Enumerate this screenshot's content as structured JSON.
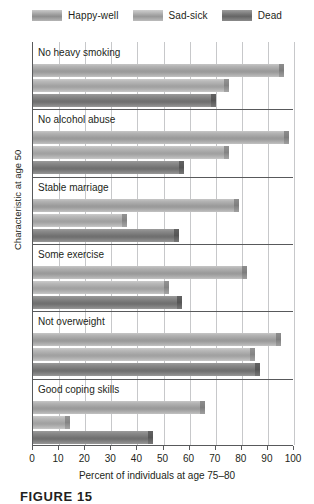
{
  "chart_data": {
    "type": "bar",
    "orientation": "horizontal",
    "title": "",
    "xlabel": "Percent of individuals at age 75–80",
    "ylabel": "Characteristic at age 50",
    "xlim": [
      0,
      100
    ],
    "xticks": [
      0,
      10,
      20,
      30,
      40,
      50,
      60,
      70,
      80,
      90,
      100
    ],
    "grid": true,
    "legend_position": "top",
    "categories": [
      "No heavy smoking",
      "No alcohol abuse",
      "Stable marriage",
      "Some exercise",
      "Not overweight",
      "Good coping skills"
    ],
    "series": [
      {
        "name": "Happy-well",
        "color": "#9b9b9b",
        "values": [
          96,
          98,
          79,
          82,
          95,
          66
        ]
      },
      {
        "name": "Sad-sick",
        "color": "#a2a2a2",
        "values": [
          75,
          75,
          36,
          52,
          85,
          14
        ]
      },
      {
        "name": "Dead",
        "color": "#717171",
        "values": [
          70,
          58,
          56,
          57,
          87,
          46
        ]
      }
    ]
  },
  "legend": {
    "items": [
      {
        "label": "Happy-well",
        "swatch": "swatch-happy-well"
      },
      {
        "label": "Sad-sick",
        "swatch": "swatch-sad-sick"
      },
      {
        "label": "Dead",
        "swatch": "swatch-dead"
      }
    ]
  },
  "axes": {
    "x_label": "Percent of individuals at age 75–80",
    "y_label": "Characteristic at age 50",
    "x_tick_labels": [
      "0",
      "10",
      "20",
      "30",
      "40",
      "50",
      "60",
      "70",
      "80",
      "90",
      "100"
    ]
  },
  "caption": {
    "text": "FIGURE 15"
  }
}
